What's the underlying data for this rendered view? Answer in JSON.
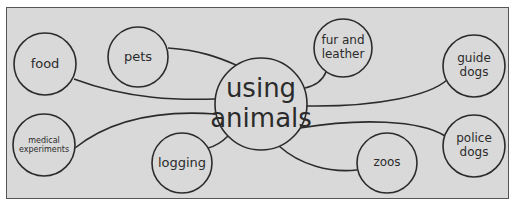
{
  "diagram": {
    "type": "mind-map",
    "center": {
      "label_lines": [
        "using",
        "animals"
      ],
      "cx": 261,
      "cy": 104,
      "r": 46,
      "font_size": 26
    },
    "nodes": [
      {
        "id": "food",
        "label_lines": [
          "food"
        ],
        "cx": 45,
        "cy": 64,
        "r": 31,
        "font_size": 13
      },
      {
        "id": "pets",
        "label_lines": [
          "pets"
        ],
        "cx": 138,
        "cy": 57,
        "r": 30,
        "font_size": 13
      },
      {
        "id": "fur-and-leather",
        "label_lines": [
          "fur and",
          "leather"
        ],
        "cx": 343,
        "cy": 48,
        "r": 29,
        "font_size": 12
      },
      {
        "id": "guide-dogs",
        "label_lines": [
          "guide",
          "dogs"
        ],
        "cx": 474,
        "cy": 66,
        "r": 31,
        "font_size": 12
      },
      {
        "id": "medical-experiments",
        "label_lines": [
          "medical",
          "experiments"
        ],
        "cx": 44,
        "cy": 145,
        "r": 31,
        "font_size": 8
      },
      {
        "id": "logging",
        "label_lines": [
          "logging"
        ],
        "cx": 182,
        "cy": 163,
        "r": 30,
        "font_size": 13
      },
      {
        "id": "zoos",
        "label_lines": [
          "zoos"
        ],
        "cx": 387,
        "cy": 163,
        "r": 30,
        "font_size": 12
      },
      {
        "id": "police-dogs",
        "label_lines": [
          "police",
          "dogs"
        ],
        "cx": 474,
        "cy": 146,
        "r": 31,
        "font_size": 12
      }
    ],
    "connectors": [
      {
        "to": "food",
        "path": "M74,79 C130,100 180,100 215,99"
      },
      {
        "to": "pets",
        "path": "M168,48 C200,50 220,58 236,65"
      },
      {
        "to": "fur-and-leather",
        "path": "M326,72 C322,82 314,86 305,88"
      },
      {
        "to": "guide-dogs",
        "path": "M307,106 C380,107 430,95 447,80"
      },
      {
        "to": "medical-experiments",
        "path": "M75,148 C110,120 160,110 216,114"
      },
      {
        "to": "logging",
        "path": "M208,148 C216,146 222,142 228,136"
      },
      {
        "to": "zoos",
        "path": "M279,146 C300,165 330,173 357,170"
      },
      {
        "to": "police-dogs",
        "path": "M300,128 C360,118 420,120 445,136"
      }
    ],
    "colors": {
      "background": "#d9d9d9",
      "stroke": "#2b2b2b",
      "text": "#2b2b2b",
      "border": "#555555"
    }
  }
}
